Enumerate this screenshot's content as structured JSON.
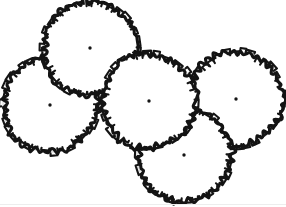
{
  "drawing": {
    "title": "Tree Canopy Layout Plan",
    "description": "Five overlapping hand-drawn tree canopy symbols arranged in a cluster, each with a center point marker and a faint gray construction circle.",
    "style": "landscape-plan-line-drawing",
    "canvas": {
      "width": 286,
      "height": 207,
      "background": "#ffffff"
    },
    "colors": {
      "outline": "#141414",
      "construction": "#d6d6d6",
      "center_dot": "#151515",
      "fill": "#ffffff",
      "artifact": "#ededed"
    },
    "line_weights": {
      "canopy_outline": 3.1,
      "construction_circle": 1.15
    }
  },
  "trees": [
    {
      "id": "tree-top",
      "label": "Top canopy",
      "center": {
        "x": 90,
        "y": 48
      },
      "canopy_radius": 47,
      "construction_radius": 47,
      "seed": 11,
      "lobes": 34,
      "roughness": 3.1
    },
    {
      "id": "tree-left",
      "label": "Left canopy",
      "center": {
        "x": 50,
        "y": 105
      },
      "canopy_radius": 47,
      "construction_radius": 47,
      "seed": 23,
      "lobes": 34,
      "roughness": 3.0
    },
    {
      "id": "tree-middle",
      "label": "Middle canopy",
      "center": {
        "x": 149,
        "y": 101
      },
      "canopy_radius": 47,
      "construction_radius": 47,
      "seed": 37,
      "lobes": 34,
      "roughness": 3.2
    },
    {
      "id": "tree-right",
      "label": "Right canopy",
      "center": {
        "x": 236,
        "y": 99
      },
      "canopy_radius": 47,
      "construction_radius": 47,
      "seed": 53,
      "lobes": 34,
      "roughness": 3.0
    },
    {
      "id": "tree-bottom",
      "label": "Bottom canopy",
      "center": {
        "x": 184,
        "y": 155
      },
      "canopy_radius": 47,
      "construction_radius": 47,
      "seed": 67,
      "lobes": 34,
      "roughness": 3.1
    }
  ],
  "draw_order": [
    "tree-left",
    "tree-right",
    "tree-top",
    "tree-bottom",
    "tree-middle"
  ],
  "center_dot_radius": 1.7,
  "artifact_line": {
    "x1": 0,
    "y1": 204.5,
    "x2": 286,
    "y2": 204.5
  }
}
